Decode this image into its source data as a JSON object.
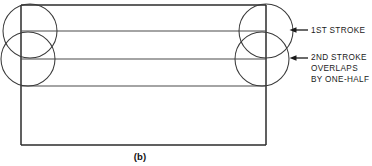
{
  "figure": {
    "caption": "(b)",
    "type": "technical-line-drawing"
  },
  "annotations": [
    {
      "id": "first-stroke",
      "lines": [
        "1ST STROKE"
      ],
      "arrow": "left-arrow-icon",
      "arrow_tip_x": 290,
      "arrow_y": 30
    },
    {
      "id": "second-stroke",
      "lines": [
        "2ND STROKE",
        "OVERLAPS",
        "BY ONE-HALF"
      ],
      "arrow": "left-arrow-icon",
      "arrow_tip_x": 290,
      "arrow_y": 58
    }
  ],
  "annotation_text": {
    "first_stroke_line1": "1ST STROKE",
    "second_stroke_line1": "2ND STROKE",
    "second_stroke_line2": "OVERLAPS",
    "second_stroke_line3": "BY ONE-HALF"
  },
  "geometry": {
    "rectangle": {
      "x": 21,
      "y": 5,
      "width": 245,
      "height": 140
    },
    "stroke_lines_y": [
      5,
      31,
      59,
      86
    ],
    "circles": [
      {
        "cx": 30,
        "cy": 31,
        "r": 27,
        "side": "left",
        "stroke": "1st"
      },
      {
        "cx": 28,
        "cy": 59,
        "r": 27,
        "side": "left",
        "stroke": "2nd"
      },
      {
        "cx": 266,
        "cy": 31,
        "r": 27,
        "side": "right",
        "stroke": "1st"
      },
      {
        "cx": 262,
        "cy": 59,
        "r": 27,
        "side": "right",
        "stroke": "2nd"
      }
    ]
  },
  "colors": {
    "line": "#2b2b2b",
    "thin_line": "#4a4a4a",
    "text": "#1a1a1a",
    "background": "#ffffff"
  }
}
